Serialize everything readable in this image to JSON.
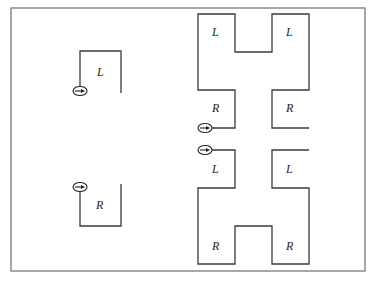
{
  "diagram": {
    "frame": {
      "x": 11,
      "y": 8,
      "w": 354,
      "h": 263,
      "stroke": "#6e6e6e"
    },
    "wall_color": "#3a3a3a",
    "labels": {
      "left_top": "L",
      "left_bottom": "R",
      "right_top_left": "L",
      "right_top_right": "L",
      "right_upper_mid_left": "R",
      "right_upper_mid_right": "R",
      "right_lower_mid_left": "L",
      "right_lower_mid_right": "L",
      "right_bottom_left": "R",
      "right_bottom_right": "R"
    },
    "start_markers": [
      {
        "id": "left-top",
        "cx": 80,
        "cy": 91,
        "icon": "arrow-right-in-ellipse"
      },
      {
        "id": "left-bottom",
        "cx": 80,
        "cy": 187,
        "icon": "arrow-right-in-ellipse"
      },
      {
        "id": "right-upper",
        "cx": 205,
        "cy": 128,
        "icon": "arrow-right-in-ellipse"
      },
      {
        "id": "right-lower",
        "cx": 205,
        "cy": 150,
        "icon": "arrow-right-in-ellipse"
      }
    ]
  }
}
